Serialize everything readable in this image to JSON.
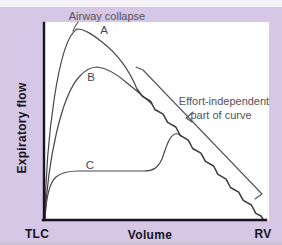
{
  "figure": {
    "annotations": {
      "airway_collapse": "Airway collapse",
      "effort_line1": "Effort-independent",
      "effort_line2": "part of curve"
    },
    "curve_labels": {
      "a": "A",
      "b": "B",
      "c": "C"
    },
    "axes": {
      "y_label": "Expiratory flow",
      "x_label": "Volume",
      "x_left_end": "TLC",
      "x_right_end": "RV"
    }
  },
  "colors": {
    "background": "#d5c7e5",
    "top_strip": "#f4f1f7",
    "bottom_strip": "#cbc2d2",
    "panel": "#ffffff",
    "axis": "#17141d",
    "curve": "#4a464e",
    "envelope": "#3a3740",
    "annotation_text": "#56515b"
  },
  "geometry": {
    "curve_a": "M45,218 C46,140 58,40 77,29 C85,29 93,35 102,42 C115,52 128,67 137,89",
    "curve_b": "M45,218 C48,160 61,97 79,77 C85,70 90,67 97,67 C106,68 117,74 127,83 C136,90 144,97 152,104",
    "curve_c": "M45,218 C46,201 49,183 56,177 C62,172 69,171 78,171 L144,171 C153,171 158,168 162,159 C166,148 169,136 175,134 C178,133 180,135 181,136",
    "envelope": "M137,89 L142.4,96.4 L150.5,101.1 L154.9,109.5 L163.1,114.2 L167.6,122.4 L175.8,127 L180.2,135.3 L188.3,140.1 L192.7,148.5 L200.9,153.2 L205.4,161.4 L213.6,166 L218,174.3 L226.1,179.1 L230.5,187.5 L238.7,192.2 L243.2,200.4 L251.4,205 L255.8,213.3 L261,216 L263,219",
    "bracket": "M136,67 L143,70 L262,194 L255,199",
    "airway_leader": "M78,22 C76,25 74,28 73,31",
    "effort_arrow": "M193,112 L186,118 L192,122",
    "y_axis": "M44,23 L44,220",
    "x_axis": "M43,220 L266,220"
  }
}
